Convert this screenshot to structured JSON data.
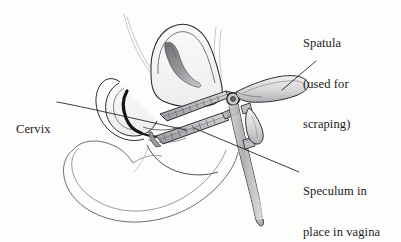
{
  "figure": {
    "medium": "pen-and-ink anatomical line drawing",
    "background_color": "#fdfdfc",
    "ink_color": "#1a1a1a",
    "shade_color": "#8c8c90"
  },
  "labels": {
    "spatula": {
      "line1": "Spatula",
      "line2": "(used for",
      "line3": "scraping)"
    },
    "cervix": {
      "line1": "Cervix"
    },
    "speculum": {
      "line1": "Speculum in",
      "line2": "place in vagina"
    }
  },
  "leader_lines": [
    {
      "name": "cervix-leader",
      "from_label": "Cervix",
      "x1": 57,
      "y1": 102,
      "x2": 186,
      "y2": 130
    },
    {
      "name": "spatula-leader",
      "from_label": "Spatula",
      "x1": 316,
      "y1": 61,
      "x2": 282,
      "y2": 90
    },
    {
      "name": "speculum-leader",
      "from_label": "Speculum in place in vagina",
      "x1": 299,
      "y1": 172,
      "x2": 194,
      "y2": 128
    }
  ],
  "anatomy_parts": [
    "uterus",
    "uterine-cavity",
    "fallopian-tube-left",
    "fallopian-tube-right",
    "bladder",
    "cervix",
    "vagina",
    "rectum"
  ],
  "instrument_parts": [
    "speculum-upper-blade",
    "speculum-lower-blade",
    "speculum-pivot",
    "speculum-thumb-lever",
    "speculum-handle",
    "spatula-blade",
    "spatula-handle"
  ]
}
